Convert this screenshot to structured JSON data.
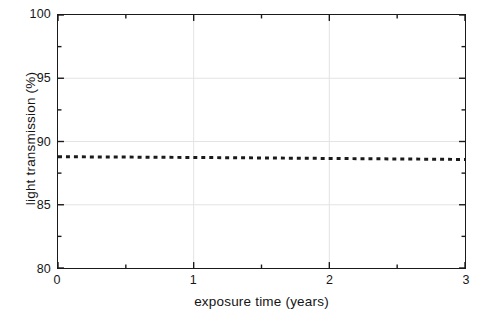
{
  "chart_data": {
    "type": "line",
    "title": "",
    "subtitle": "",
    "xlabel": "exposure time (years)",
    "ylabel": "light transmission (%)",
    "xlim": [
      0,
      3
    ],
    "ylim": [
      80,
      100
    ],
    "x_major_ticks": [
      0,
      1,
      2,
      3
    ],
    "x_minor_ticks": [
      0.5,
      1.5,
      2.5
    ],
    "x_tick_labels": [
      "0",
      "1",
      "2",
      "3"
    ],
    "y_major_ticks": [
      80,
      85,
      90,
      95,
      100
    ],
    "y_minor_ticks": [
      82.5,
      87.5,
      92.5,
      97.5
    ],
    "y_tick_labels": [
      "80",
      "85",
      "90",
      "95",
      "100"
    ],
    "grid": true,
    "grid_x_values": [
      1,
      2
    ],
    "grid_y_values": [
      85,
      90,
      95
    ],
    "grid_color": "#e3e3e3",
    "axis_color": "#1a1a1a",
    "legend": null,
    "legend_position": "none",
    "annotations": [],
    "series": [
      {
        "name": "light transmission",
        "style": "dotted",
        "color": "#1a1a1a",
        "linewidth": 3,
        "dash_pattern": "4 4",
        "x": [
          0.0,
          0.25,
          0.5,
          0.75,
          1.0,
          1.25,
          1.5,
          1.75,
          2.0,
          2.25,
          2.5,
          2.75,
          3.0
        ],
        "values": [
          88.8,
          88.78,
          88.77,
          88.75,
          88.74,
          88.72,
          88.7,
          88.68,
          88.66,
          88.64,
          88.62,
          88.6,
          88.58
        ]
      }
    ]
  },
  "figure": {
    "background_color": "#ffffff",
    "width": 480,
    "height": 322
  }
}
